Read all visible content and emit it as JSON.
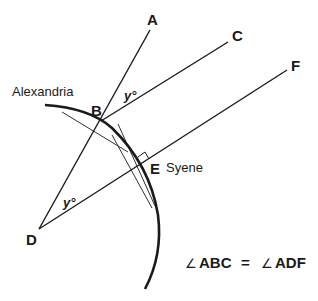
{
  "diagram": {
    "points": {
      "A": "A",
      "B": "B",
      "C": "C",
      "D": "D",
      "E": "E",
      "F": "F"
    },
    "places": {
      "alexandria": "Alexandria",
      "syene": "Syene"
    },
    "angles": {
      "at_B": "y°",
      "at_D": "y°"
    },
    "equation": {
      "angle_symbol": "∠",
      "left": "ABC",
      "equals": "=",
      "right": "ADF"
    },
    "colors": {
      "ink": "#1a1a1a",
      "background": "#ffffff"
    }
  }
}
